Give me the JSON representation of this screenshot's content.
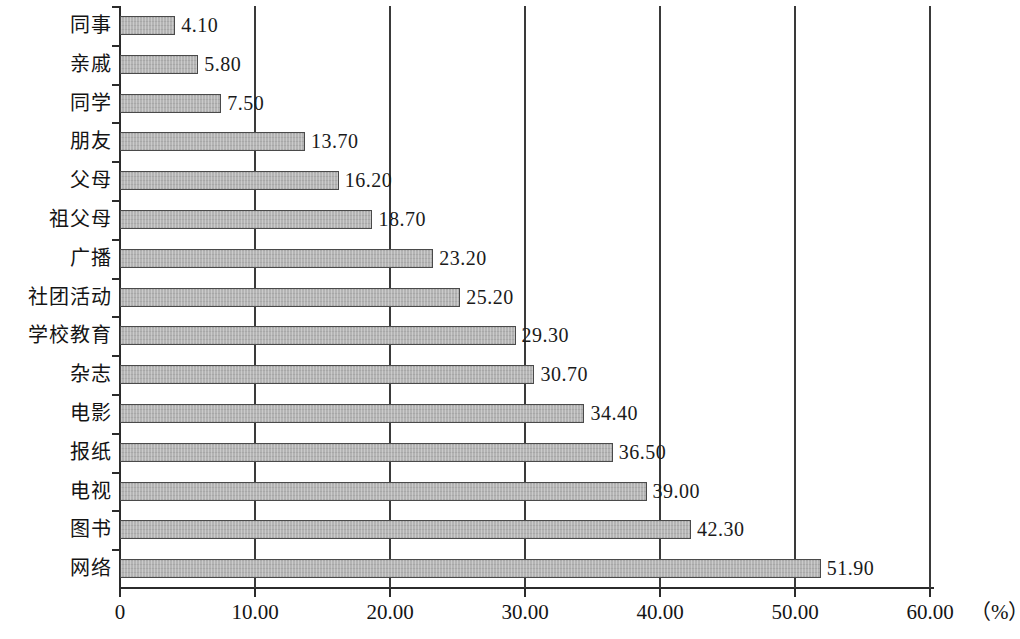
{
  "chart_data": {
    "type": "bar",
    "orientation": "horizontal",
    "title": "",
    "subtitle": "",
    "xlabel": "（%）",
    "ylabel": "",
    "xlim": [
      0,
      60
    ],
    "grid": true,
    "legend": null,
    "unit_label": "（%）",
    "categories": [
      "同事",
      "亲戚",
      "同学",
      "朋友",
      "父母",
      "祖父母",
      "广播",
      "社团活动",
      "学校教育",
      "杂志",
      "电影",
      "报纸",
      "电视",
      "图书",
      "网络"
    ],
    "values": [
      4.1,
      5.8,
      7.5,
      13.7,
      16.2,
      18.7,
      23.2,
      25.2,
      29.3,
      30.7,
      34.4,
      36.5,
      39.0,
      42.3,
      51.9
    ],
    "value_labels": [
      "4.10",
      "5.80",
      "7.50",
      "13.70",
      "16.20",
      "18.70",
      "23.20",
      "25.20",
      "29.30",
      "30.70",
      "34.40",
      "36.50",
      "39.00",
      "42.30",
      "51.90"
    ],
    "xticks": [
      0,
      10,
      20,
      30,
      40,
      50,
      60
    ],
    "xtick_labels": [
      "0",
      "10.00",
      "20.00",
      "30.00",
      "40.00",
      "50.00",
      "60.00"
    ],
    "bar_color": "#b4b4b4",
    "bar_border_color": "#4a4a4a",
    "axis_color": "#2b2b2b",
    "text_color": "#141414",
    "background": "#ffffff"
  }
}
